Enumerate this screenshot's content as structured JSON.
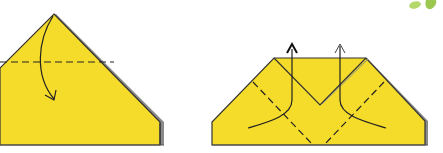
{
  "diagram": {
    "title": "Origami folding steps",
    "colors": {
      "paper": "#f6dc2a",
      "paper_edge": "#333333",
      "edge_shadow": "#8a8a8a",
      "leaf": "#a8cf5a",
      "background": "#ffffff"
    },
    "steps": [
      {
        "id": "step-1",
        "description": "Valley fold the top point down along the dashed line",
        "fold_lines": 1,
        "arrows": [
          {
            "type": "curved",
            "direction": "down"
          }
        ]
      },
      {
        "id": "step-2",
        "description": "Fold the diagonal flaps up along the dashed lines",
        "fold_lines": 4,
        "arrows": [
          {
            "type": "curved-up",
            "direction": "up",
            "style": "solid-head"
          },
          {
            "type": "curved-up",
            "direction": "up",
            "style": "open-head"
          }
        ]
      }
    ],
    "decoration": "green-leaf-corner"
  }
}
